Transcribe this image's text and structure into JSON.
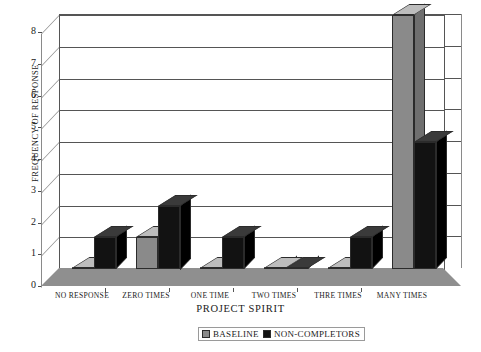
{
  "chart_data": {
    "type": "bar",
    "title": "",
    "xlabel": "PROJECT SPIRIT",
    "ylabel": "FREQUENCY OF RESPONSE",
    "categories": [
      "NO RESPONSE",
      "ZERO TIMES",
      "ONE TIME",
      "TWO TIMES",
      "THRE TIMES",
      "MANY TIMES"
    ],
    "series": [
      {
        "name": "BASELINE",
        "color": "#8a8a8a",
        "values": [
          0,
          1,
          0,
          0,
          0,
          8
        ]
      },
      {
        "name": "NON-COMPLETORS",
        "color": "#121212",
        "values": [
          1,
          2,
          1,
          0,
          1,
          4
        ]
      }
    ],
    "ylim": [
      0,
      8
    ],
    "yticks": [
      0,
      1,
      2,
      3,
      4,
      5,
      6,
      7,
      8
    ],
    "ytick_labels": [
      "0",
      "1",
      "2",
      "3",
      "4",
      "5",
      "6",
      "7",
      "8"
    ],
    "grid": true,
    "legend_position": "bottom",
    "render": "3d-column"
  },
  "axis": {
    "y_title": "FREQUENCY OF RESPONSE",
    "x_title": "PROJECT SPIRIT",
    "y_labels": [
      "8",
      "7",
      "6",
      "5",
      "4",
      "3",
      "2",
      "1",
      "0"
    ]
  },
  "legend": {
    "items": [
      {
        "label": "BASELINE",
        "color": "#8a8a8a"
      },
      {
        "label": "NON-COMPLETORS",
        "color": "#121212"
      }
    ]
  }
}
